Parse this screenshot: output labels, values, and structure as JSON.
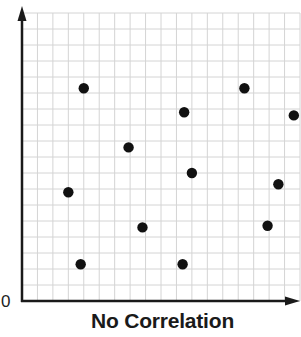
{
  "chart_data": {
    "type": "scatter",
    "title": "No Correlation",
    "xlabel": "",
    "ylabel": "",
    "origin_label": "0",
    "grid": true,
    "grid_cells": {
      "x": 18,
      "y": 18
    },
    "xlim": [
      0,
      18
    ],
    "ylim": [
      0,
      18
    ],
    "legend": null,
    "points": [
      {
        "x": 4.0,
        "y": 13.3
      },
      {
        "x": 6.9,
        "y": 9.6
      },
      {
        "x": 3.0,
        "y": 6.8
      },
      {
        "x": 7.8,
        "y": 4.6
      },
      {
        "x": 3.8,
        "y": 2.3
      },
      {
        "x": 10.5,
        "y": 11.8
      },
      {
        "x": 11.0,
        "y": 8.0
      },
      {
        "x": 10.4,
        "y": 2.3
      },
      {
        "x": 14.4,
        "y": 13.3
      },
      {
        "x": 17.6,
        "y": 11.6
      },
      {
        "x": 16.6,
        "y": 7.3
      },
      {
        "x": 15.9,
        "y": 4.7
      }
    ],
    "colors": {
      "point": "#111111",
      "axis": "#1a1a1a",
      "grid": "#d4d4d4"
    }
  }
}
